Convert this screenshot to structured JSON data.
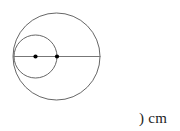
{
  "figure": {
    "background_color": "#ffffff",
    "stroke_color": "#555555",
    "line_color": "#777777",
    "dot_color": "#000000",
    "large_circle": {
      "name": "large-circle",
      "cx": 56.5,
      "cy": 56.5,
      "r": 43.5,
      "stroke": "#555555",
      "stroke_width": 0.9,
      "fill": "none"
    },
    "small_circle": {
      "name": "small-circle",
      "cx": 35.5,
      "cy": 56.5,
      "r": 21.5,
      "stroke": "#555555",
      "stroke_width": 0.9,
      "fill": "none"
    },
    "diameter_line": {
      "name": "diameter-line",
      "x1": 13.0,
      "y1": 56.5,
      "x2": 100.5,
      "y2": 56.5,
      "stroke": "#777777",
      "stroke_width": 1.1
    },
    "center_dots": [
      {
        "name": "small-circle-center-dot",
        "cx": 35.5,
        "cy": 56.5,
        "r": 2.1,
        "fill": "#000000"
      },
      {
        "name": "large-circle-center-dot",
        "cx": 57.0,
        "cy": 56.5,
        "r": 2.1,
        "fill": "#000000"
      }
    ]
  },
  "labels": {
    "unit_text": ") cm"
  }
}
